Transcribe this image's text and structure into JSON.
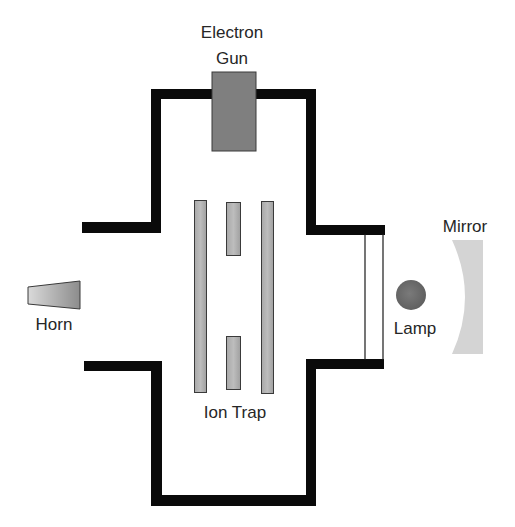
{
  "diagram": {
    "type": "apparatus-schematic",
    "colors": {
      "background": "#ffffff",
      "wall": "#0a0a0a",
      "electron_gun": "#7f7f7f",
      "rod_fill": "#b0b0b0",
      "rod_stroke": "#3a3a3a",
      "horn_light": "#d6d6d6",
      "horn_dark": "#8a8a8a",
      "lamp": "#6f6f6f",
      "mirror": "#d4d4d4",
      "window_stroke": "#1a1a1a",
      "text": "#262626"
    },
    "labels": {
      "electron_gun_line1": "Electron",
      "electron_gun_line2": "Gun",
      "horn": "Horn",
      "ion_trap": "Ion Trap",
      "lamp": "Lamp",
      "mirror": "Mirror"
    },
    "components": [
      {
        "id": "vacuum-chamber",
        "name": "Vacuum chamber (cross-shaped wall)"
      },
      {
        "id": "electron-gun",
        "name": "Electron Gun"
      },
      {
        "id": "ion-trap",
        "name": "Ion Trap",
        "electrodes": [
          "outer-rod-left",
          "segment-top",
          "segment-bottom",
          "outer-rod-right"
        ]
      },
      {
        "id": "horn",
        "name": "Horn"
      },
      {
        "id": "window",
        "name": "Optical window"
      },
      {
        "id": "lamp",
        "name": "Lamp"
      },
      {
        "id": "mirror",
        "name": "Mirror"
      }
    ]
  }
}
